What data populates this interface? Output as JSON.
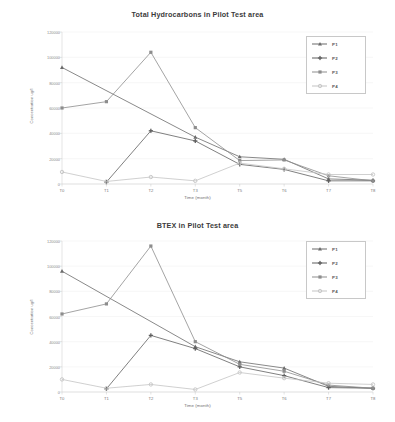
{
  "charts": [
    {
      "id": "total-hydrocarbons",
      "title": "Total Hydrocarbons in Pilot Test area",
      "xlabel": "Time (month)",
      "ylabel": "Concentration ug/l",
      "ytick_labels": [
        "0",
        "20000",
        "40000",
        "60000",
        "80000",
        "100000",
        "120000"
      ],
      "xtick_labels": [
        "T0",
        "T1",
        "T2",
        "T3",
        "T5",
        "T6",
        "T7",
        "T8"
      ],
      "legend": [
        "P1",
        "P2",
        "P3",
        "P4"
      ]
    },
    {
      "id": "btex",
      "title": "BTEX in Pilot Test area",
      "xlabel": "Time (month)",
      "ylabel": "Concentration ug/l",
      "ytick_labels": [
        "0",
        "20000",
        "40000",
        "60000",
        "80000",
        "100000",
        "120000"
      ],
      "xtick_labels": [
        "T0",
        "T1",
        "T2",
        "T3",
        "T5",
        "T6",
        "T7",
        "T8"
      ],
      "legend": [
        "P1",
        "P2",
        "P3",
        "P4"
      ]
    }
  ],
  "chart_data": [
    {
      "type": "line",
      "title": "Total Hydrocarbons in Pilot Test area",
      "xlabel": "Time (month)",
      "ylabel": "Concentration ug/l",
      "categories": [
        "T0",
        "T1",
        "T2",
        "T3",
        "T5",
        "T6",
        "T7",
        "T8"
      ],
      "ylim": [
        0,
        120000
      ],
      "ytick_interval": 20000,
      "grid": true,
      "legend_position": "top-right",
      "series": [
        {
          "name": "P1",
          "marker": "triangle",
          "color": "#6b6b6b",
          "values": [
            92000,
            null,
            null,
            37000,
            21500,
            19500,
            4000,
            3000
          ]
        },
        {
          "name": "P2",
          "marker": "plus",
          "color": "#5f5f5f",
          "values": [
            null,
            1500,
            42000,
            34000,
            15500,
            11500,
            2500,
            2500
          ]
        },
        {
          "name": "P3",
          "marker": "square",
          "color": "#8d8d8d",
          "values": [
            60000,
            65000,
            104000,
            44500,
            18500,
            19000,
            6500,
            2500
          ]
        },
        {
          "name": "P4",
          "marker": "circle",
          "color": "#c4c4c4",
          "values": [
            9500,
            2000,
            5500,
            2500,
            16500,
            12000,
            7500,
            7500
          ]
        }
      ]
    },
    {
      "type": "line",
      "title": "BTEX in Pilot Test area",
      "xlabel": "Time (month)",
      "ylabel": "Concentration ug/l",
      "categories": [
        "T0",
        "T1",
        "T2",
        "T3",
        "T5",
        "T6",
        "T7",
        "T8"
      ],
      "ylim": [
        0,
        120000
      ],
      "ytick_interval": 20000,
      "grid": true,
      "legend_position": "top-right",
      "series": [
        {
          "name": "P1",
          "marker": "triangle",
          "color": "#6b6b6b",
          "values": [
            96000,
            null,
            null,
            36000,
            24000,
            19000,
            4500,
            3000
          ]
        },
        {
          "name": "P2",
          "marker": "plus",
          "color": "#5f5f5f",
          "values": [
            null,
            2500,
            45000,
            34500,
            20000,
            13000,
            3500,
            3000
          ]
        },
        {
          "name": "P3",
          "marker": "square",
          "color": "#8d8d8d",
          "values": [
            62000,
            70000,
            116000,
            40000,
            22000,
            16500,
            5500,
            3000
          ]
        },
        {
          "name": "P4",
          "marker": "circle",
          "color": "#c4c4c4",
          "values": [
            10000,
            3000,
            6000,
            2000,
            15500,
            11000,
            7000,
            6000
          ]
        }
      ]
    }
  ]
}
